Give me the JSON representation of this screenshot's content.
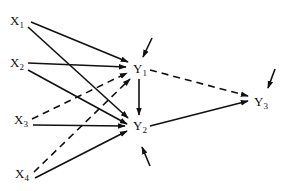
{
  "diagram": {
    "type": "path-diagram",
    "nodes": [
      {
        "id": "X1",
        "base": "X",
        "sub": "1",
        "x": 10,
        "y": 14
      },
      {
        "id": "X2",
        "base": "X",
        "sub": "2",
        "x": 10,
        "y": 56
      },
      {
        "id": "X3",
        "base": "X",
        "sub": "3",
        "x": 14,
        "y": 113
      },
      {
        "id": "X4",
        "base": "X",
        "sub": "4",
        "x": 15,
        "y": 167
      },
      {
        "id": "Y1",
        "base": "Y",
        "sub": "1",
        "x": 133,
        "y": 62
      },
      {
        "id": "Y2",
        "base": "Y",
        "sub": "2",
        "x": 133,
        "y": 119
      },
      {
        "id": "Y3",
        "base": "Y",
        "sub": "3",
        "x": 254,
        "y": 95
      }
    ],
    "edges": [
      {
        "from": "X1",
        "to": "Y1",
        "style": "solid",
        "x1": 31,
        "y1": 22,
        "x2": 128,
        "y2": 62
      },
      {
        "from": "X1",
        "to": "Y2",
        "style": "solid",
        "x1": 28,
        "y1": 27,
        "x2": 128,
        "y2": 118
      },
      {
        "from": "X2",
        "to": "Y1",
        "style": "solid",
        "x1": 28,
        "y1": 63,
        "x2": 126,
        "y2": 67
      },
      {
        "from": "X2",
        "to": "Y2",
        "style": "solid",
        "x1": 28,
        "y1": 70,
        "x2": 127,
        "y2": 124
      },
      {
        "from": "X3",
        "to": "Y1",
        "style": "dashed",
        "x1": 32,
        "y1": 119,
        "x2": 127,
        "y2": 73
      },
      {
        "from": "X3",
        "to": "Y2",
        "style": "solid",
        "x1": 33,
        "y1": 125,
        "x2": 125,
        "y2": 126
      },
      {
        "from": "X4",
        "to": "Y1",
        "style": "dashed",
        "x1": 34,
        "y1": 172,
        "x2": 130,
        "y2": 79
      },
      {
        "from": "X4",
        "to": "Y2",
        "style": "solid",
        "x1": 35,
        "y1": 178,
        "x2": 127,
        "y2": 131
      },
      {
        "from": "Y1",
        "to": "Y2",
        "style": "solid",
        "x1": 139,
        "y1": 79,
        "x2": 139,
        "y2": 115
      },
      {
        "from": "Y1",
        "to": "Y3",
        "style": "dashed",
        "x1": 150,
        "y1": 70,
        "x2": 248,
        "y2": 96
      },
      {
        "from": "Y2",
        "to": "Y3",
        "style": "solid",
        "x1": 150,
        "y1": 126,
        "x2": 248,
        "y2": 101
      }
    ],
    "disturbances": [
      {
        "target": "Y1",
        "x1": 152,
        "y1": 38,
        "x2": 143,
        "y2": 57
      },
      {
        "target": "Y2",
        "x1": 150,
        "y1": 166,
        "x2": 142,
        "y2": 147
      },
      {
        "target": "Y3",
        "x1": 275,
        "y1": 69,
        "x2": 268,
        "y2": 88
      }
    ]
  }
}
